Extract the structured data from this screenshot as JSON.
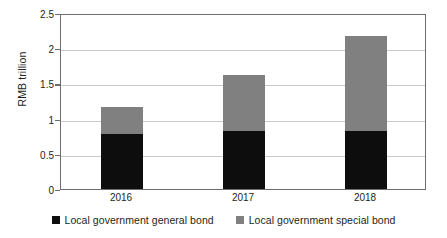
{
  "chart_data": {
    "type": "bar",
    "subtype": "stacked-bar",
    "title": "",
    "xlabel": "",
    "ylabel": "RMB trillion",
    "categories": [
      "2016",
      "2017",
      "2018"
    ],
    "series": [
      {
        "name": "Local government general bond",
        "color": "#0d0d0d",
        "values": [
          0.78,
          0.82,
          0.82
        ]
      },
      {
        "name": "Local government special bond",
        "color": "#808080",
        "values": [
          0.39,
          0.8,
          1.35
        ]
      }
    ],
    "totals": [
      1.17,
      1.62,
      2.17
    ],
    "ylim": [
      0,
      2.5
    ],
    "ytick_values": [
      0,
      0.5,
      1,
      1.5,
      2,
      2.5
    ],
    "ytick_labels": [
      "0",
      "0.5",
      "1",
      "1.5",
      "2",
      "2.5"
    ],
    "grid": true,
    "grid_axis": "y",
    "legend_position": "bottom",
    "gridline_color": "#c9cacc",
    "axis_color": "#6d6e71",
    "background_color": "#ffffff"
  },
  "legend": {
    "items": [
      {
        "label": "Local government general bond",
        "color": "#0d0d0d"
      },
      {
        "label": "Local government special bond",
        "color": "#808080"
      }
    ]
  }
}
